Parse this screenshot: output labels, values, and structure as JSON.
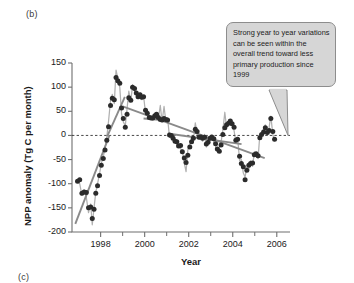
{
  "figure": {
    "panel_label": "(b)",
    "next_panel_label": "(c)"
  },
  "callout": {
    "text": "Strong year to year variations can be seen within the overall trend toward less primary production since 1999",
    "fill_color": "#d6d6d6",
    "border_color": "#8d8d8d"
  },
  "axes": {
    "x_title": "Year",
    "y_title": "NPP anomaly (Tg C per month)",
    "x_major_ticks": [
      "1998",
      "2000",
      "2002",
      "2004",
      "2006"
    ],
    "x_minor_ticks": [
      "1999",
      "2001",
      "2003",
      "2005"
    ],
    "y_ticks": [
      "150",
      "100",
      "50",
      "0",
      "-50",
      "-100",
      "-150",
      "-200"
    ]
  },
  "colors": {
    "marker": "#2b2b2b",
    "raw_line": "#b0b0b0",
    "trend_line": "#8a8a8a",
    "zero_line": "#333333",
    "axis": "#6f6f6f"
  },
  "chart_data": {
    "type": "line",
    "title": "",
    "xlabel": "Year",
    "ylabel": "NPP anomaly (Tg C per month)",
    "xlim": [
      1996.7,
      2006.6
    ],
    "ylim": [
      -200,
      150
    ],
    "grid": false,
    "legend": null,
    "zero_reference_line": 0,
    "annotations": [
      {
        "text": "Strong year to year variations can be seen within the overall trend toward less primary production since 1999",
        "points_to": {
          "x": 2006.4,
          "y": 0
        }
      }
    ],
    "series": [
      {
        "name": "NPP anomaly (monthly, markers)",
        "style": "markers",
        "x": [
          1996.95,
          1997.05,
          1997.15,
          1997.25,
          1997.35,
          1997.45,
          1997.55,
          1997.62,
          1997.7,
          1997.78,
          1997.86,
          1997.95,
          1998.03,
          1998.12,
          1998.2,
          1998.28,
          1998.36,
          1998.45,
          1998.53,
          1998.62,
          1998.7,
          1998.78,
          1998.87,
          1998.95,
          1999.03,
          1999.12,
          1999.2,
          1999.28,
          1999.37,
          1999.45,
          1999.54,
          1999.62,
          1999.7,
          1999.79,
          1999.87,
          1999.95,
          2000.04,
          2000.12,
          2000.21,
          2000.29,
          2000.37,
          2000.46,
          2000.54,
          2000.62,
          2000.71,
          2000.79,
          2000.88,
          2000.96,
          2001.04,
          2001.13,
          2001.21,
          2001.29,
          2001.38,
          2001.46,
          2001.54,
          2001.63,
          2001.71,
          2001.8,
          2001.88,
          2001.96,
          2002.05,
          2002.13,
          2002.21,
          2002.3,
          2002.38,
          2002.47,
          2002.55,
          2002.63,
          2002.72,
          2002.8,
          2002.88,
          2002.97,
          2003.05,
          2003.14,
          2003.22,
          2003.3,
          2003.39,
          2003.47,
          2003.55,
          2003.64,
          2003.72,
          2003.81,
          2003.89,
          2003.97,
          2004.06,
          2004.14,
          2004.22,
          2004.31,
          2004.39,
          2004.48,
          2004.56,
          2004.64,
          2004.73,
          2004.81,
          2004.9,
          2004.98,
          2005.06,
          2005.15,
          2005.23,
          2005.31,
          2005.4,
          2005.48,
          2005.57,
          2005.65,
          2005.73,
          2005.82,
          2005.9
        ],
        "y": [
          -95,
          -92,
          -120,
          -117,
          -118,
          -150,
          -148,
          -172,
          -153,
          -120,
          -104,
          -83,
          -62,
          -48,
          -30,
          -10,
          18,
          62,
          77,
          74,
          120,
          113,
          108,
          57,
          35,
          17,
          44,
          78,
          73,
          100,
          97,
          88,
          80,
          84,
          79,
          80,
          52,
          46,
          37,
          36,
          36,
          41,
          44,
          37,
          33,
          32,
          35,
          33,
          32,
          1,
          0,
          -6,
          -12,
          -13,
          -22,
          -21,
          -34,
          -47,
          -56,
          -41,
          -24,
          -13,
          -6,
          13,
          8,
          -4,
          -3,
          -6,
          -4,
          -18,
          -14,
          -6,
          -3,
          -7,
          -17,
          -28,
          -33,
          -20,
          2,
          16,
          22,
          25,
          30,
          24,
          17,
          -10,
          -8,
          -43,
          -58,
          -65,
          -92,
          -72,
          -62,
          -58,
          -57,
          -40,
          -38,
          -42,
          -5,
          2,
          7,
          16,
          6,
          10,
          35,
          8,
          -8
        ]
      },
      {
        "name": "NPP anomaly (raw monthly line)",
        "style": "line",
        "x": [
          1996.95,
          1997.05,
          1997.15,
          1997.25,
          1997.35,
          1997.45,
          1997.55,
          1997.62,
          1997.7,
          1997.78,
          1997.86,
          1997.95,
          1998.03,
          1998.12,
          1998.2,
          1998.28,
          1998.36,
          1998.45,
          1998.53,
          1998.62,
          1998.7,
          1998.78,
          1998.87,
          1998.95,
          1999.03,
          1999.12,
          1999.2,
          1999.28,
          1999.37,
          1999.45,
          1999.54,
          1999.62,
          1999.7,
          1999.79,
          1999.87,
          1999.95,
          2000.04,
          2000.12,
          2000.21,
          2000.29,
          2000.37,
          2000.46,
          2000.54,
          2000.62,
          2000.71,
          2000.79,
          2000.88,
          2000.96,
          2001.04,
          2001.13,
          2001.21,
          2001.29,
          2001.38,
          2001.46,
          2001.54,
          2001.63,
          2001.71,
          2001.8,
          2001.88,
          2001.96,
          2002.05,
          2002.13,
          2002.21,
          2002.3,
          2002.38,
          2002.47,
          2002.55,
          2002.63,
          2002.72,
          2002.8,
          2002.88,
          2002.97,
          2003.05,
          2003.14,
          2003.22,
          2003.3,
          2003.39,
          2003.47,
          2003.55,
          2003.64,
          2003.72,
          2003.81,
          2003.89,
          2003.97,
          2004.06,
          2004.14,
          2004.22,
          2004.31,
          2004.39,
          2004.48,
          2004.56,
          2004.64,
          2004.73,
          2004.81,
          2004.9,
          2004.98,
          2005.06,
          2005.15,
          2005.23,
          2005.31,
          2005.4,
          2005.48,
          2005.57,
          2005.65,
          2005.73,
          2005.82,
          2005.9
        ],
        "y": [
          -95,
          -100,
          -124,
          -113,
          -128,
          -160,
          -142,
          -185,
          -150,
          -118,
          -100,
          -80,
          -58,
          -45,
          -26,
          -4,
          30,
          72,
          85,
          66,
          135,
          118,
          100,
          45,
          28,
          20,
          55,
          92,
          70,
          105,
          92,
          84,
          76,
          88,
          74,
          82,
          46,
          50,
          33,
          40,
          32,
          46,
          40,
          34,
          62,
          28,
          60,
          30,
          36,
          -4,
          4,
          -10,
          -8,
          -20,
          -18,
          -28,
          -30,
          -58,
          -75,
          -30,
          -20,
          -8,
          -12,
          26,
          4,
          -8,
          0,
          -12,
          2,
          -24,
          -10,
          -2,
          0,
          -12,
          -22,
          -34,
          -28,
          -14,
          10,
          48,
          16,
          32,
          24,
          28,
          10,
          -14,
          -4,
          -52,
          -50,
          -78,
          -86,
          -66,
          -70,
          -52,
          -64,
          -34,
          -44,
          -48,
          2,
          -4,
          14,
          22,
          0,
          16,
          40,
          2,
          -12
        ]
      },
      {
        "name": "Trend segment 1997-1998 (rising)",
        "style": "trend",
        "x": [
          1996.85,
          1998.4
        ],
        "y": [
          -183,
          0
        ]
      },
      {
        "name": "Trend segment 1998-1999 (rising)",
        "style": "trend",
        "x": [
          1998.3,
          1999.1
        ],
        "y": [
          -2,
          80
        ]
      },
      {
        "name": "Trend segment 1999-2006 (declining)",
        "style": "trend",
        "x": [
          1999.0,
          2005.45
        ],
        "y": [
          60,
          -47
        ]
      },
      {
        "name": "Trend segment 2000-2001 plateau",
        "style": "trend",
        "x": [
          1999.95,
          2001.05
        ],
        "y": [
          35,
          31
        ]
      },
      {
        "name": "Trend segment 2001-2004 declining",
        "style": "trend",
        "x": [
          2001.05,
          2004.4
        ],
        "y": [
          4,
          -18
        ]
      }
    ]
  }
}
